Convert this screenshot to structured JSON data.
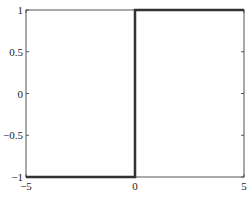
{
  "chart_data": {
    "type": "line",
    "title": "",
    "xlabel": "",
    "ylabel": "",
    "xlim": [
      -5,
      5
    ],
    "ylim": [
      -1,
      1
    ],
    "grid": false,
    "legend": null,
    "x_ticks": [
      -5,
      0,
      5
    ],
    "x_tick_labels": [
      "−5",
      "0",
      "5"
    ],
    "y_ticks": [
      1,
      0.5,
      0,
      -0.5,
      -1
    ],
    "y_tick_labels": [
      "1",
      "0.5",
      "0",
      "−0.5",
      "−1"
    ],
    "series": [
      {
        "name": "sign(x) step",
        "color": "#333333",
        "x": [
          -5,
          0,
          0,
          5
        ],
        "y": [
          -1,
          -1,
          1,
          1
        ]
      }
    ]
  },
  "layout": {
    "frame_color": "#555555",
    "line_color": "#333333",
    "background": "#ffffff"
  }
}
